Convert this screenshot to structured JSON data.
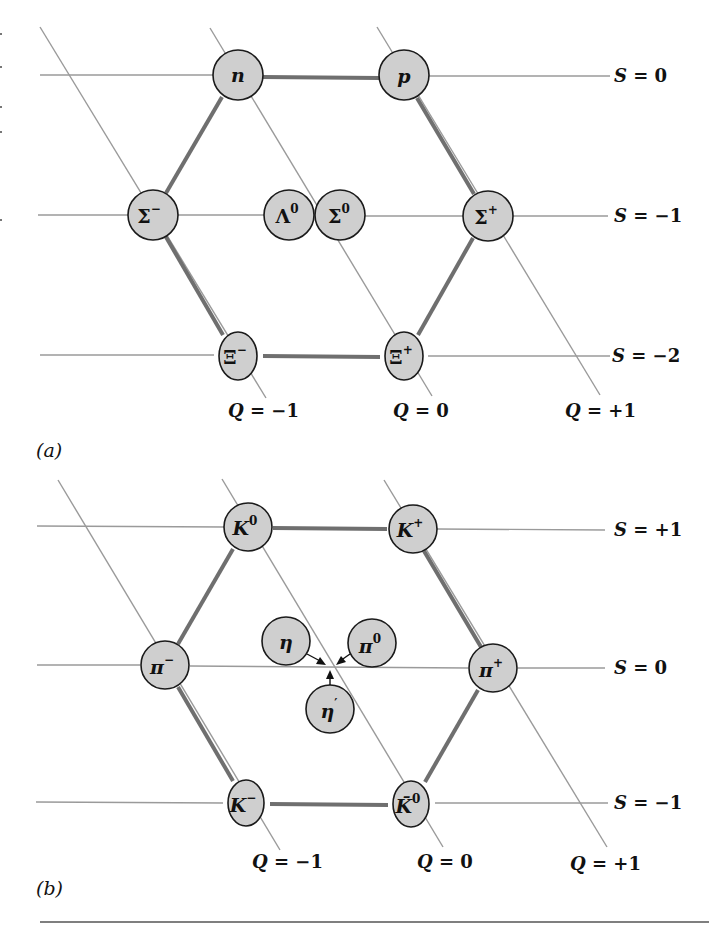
{
  "figure": {
    "panels": [
      {
        "id": "a",
        "label": "(a)",
        "kind": "baryon-octet",
        "strangeness_lines": [
          {
            "label_var": "S",
            "label_eq": " = 0",
            "y": 75
          },
          {
            "label_var": "S",
            "label_eq": " = −1",
            "y": 215
          },
          {
            "label_var": "S",
            "label_eq": " = −2",
            "y": 355
          }
        ],
        "charge_lines": [
          {
            "label_var": "Q",
            "label_eq": " = −1"
          },
          {
            "label_var": "Q",
            "label_eq": " = 0"
          },
          {
            "label_var": "Q",
            "label_eq": " = +1"
          }
        ],
        "particles": [
          {
            "name": "n",
            "base": "n",
            "sup": "",
            "S": 0,
            "Q": 0
          },
          {
            "name": "p",
            "base": "p",
            "sup": "",
            "S": 0,
            "Q": 1
          },
          {
            "name": "Sigma-minus",
            "base": "Σ",
            "sup": "−",
            "S": -1,
            "Q": -1
          },
          {
            "name": "Lambda0",
            "base": "Λ",
            "sup": "0",
            "S": -1,
            "Q": 0
          },
          {
            "name": "Sigma0",
            "base": "Σ",
            "sup": "0",
            "S": -1,
            "Q": 0
          },
          {
            "name": "Sigma-plus",
            "base": "Σ",
            "sup": "+",
            "S": -1,
            "Q": 1
          },
          {
            "name": "Xi-minus",
            "base": "Ξ",
            "sup": "−",
            "S": -2,
            "Q": -1
          },
          {
            "name": "Xi-plus",
            "base": "Ξ",
            "sup": "+",
            "S": -2,
            "Q": 0
          }
        ]
      },
      {
        "id": "b",
        "label": "(b)",
        "kind": "meson-octet",
        "strangeness_lines": [
          {
            "label_var": "S",
            "label_eq": " = +1",
            "y": 527
          },
          {
            "label_var": "S",
            "label_eq": " = 0",
            "y": 667
          },
          {
            "label_var": "S",
            "label_eq": " = −1",
            "y": 803
          }
        ],
        "charge_lines": [
          {
            "label_var": "Q",
            "label_eq": " = −1"
          },
          {
            "label_var": "Q",
            "label_eq": " = 0"
          },
          {
            "label_var": "Q",
            "label_eq": " = +1"
          }
        ],
        "particles": [
          {
            "name": "K0",
            "base": "K",
            "sup": "0",
            "S": 1,
            "Q": 0
          },
          {
            "name": "K-plus",
            "base": "K",
            "sup": "+",
            "S": 1,
            "Q": 1
          },
          {
            "name": "pi-minus",
            "base": "π",
            "sup": "−",
            "S": 0,
            "Q": -1
          },
          {
            "name": "pi-plus",
            "base": "π",
            "sup": "+",
            "S": 0,
            "Q": 1
          },
          {
            "name": "eta",
            "base": "η",
            "sup": "",
            "S": 0,
            "Q": 0
          },
          {
            "name": "pi0",
            "base": "π",
            "sup": "0",
            "S": 0,
            "Q": 0
          },
          {
            "name": "eta-prime",
            "base": "η",
            "sup": "′",
            "S": 0,
            "Q": 0
          },
          {
            "name": "K-minus",
            "base": "K",
            "sup": "−",
            "S": -1,
            "Q": -1
          },
          {
            "name": "K0-bar",
            "base": "K̄",
            "sup": "0",
            "S": -1,
            "Q": 0
          }
        ]
      }
    ],
    "colors": {
      "node_fill": "#cfcfcf",
      "node_stroke": "#1a1a1a",
      "thin_line": "#9a9a9a",
      "thick_line": "#6f6f6f"
    }
  }
}
